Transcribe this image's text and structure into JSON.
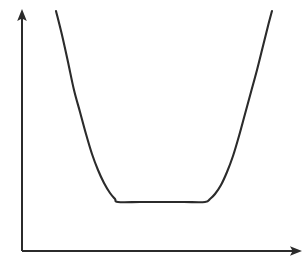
{
  "figure": {
    "title": "",
    "caption": "",
    "background_color": "#ffffff",
    "width": 305,
    "height": 271
  },
  "axes": {
    "stroke_color": "#2b2b2b",
    "stroke_width": 2,
    "origin": {
      "x": 22,
      "y": 251
    },
    "x_axis": {
      "label": "",
      "has_arrowhead": true,
      "from": {
        "x": 22,
        "y": 251
      },
      "to": {
        "x": 302,
        "y": 251
      },
      "tick_labels": []
    },
    "y_axis": {
      "label": "",
      "has_arrowhead": true,
      "from": {
        "x": 22,
        "y": 251
      },
      "to": {
        "x": 22,
        "y": 9
      },
      "tick_labels": []
    },
    "grid": false,
    "legend": null
  },
  "chart_data": {
    "type": "line",
    "title": "",
    "subtitle": "",
    "xlabel": "",
    "ylabel": "",
    "grid": false,
    "legend_position": "none",
    "xlim": [
      22,
      302
    ],
    "ylim": [
      251,
      9
    ],
    "axis_direction": {
      "x": "rightward-increasing",
      "y": "upward-increasing"
    },
    "series": [
      {
        "name": "flat-bottomed-u-curve",
        "color": "#2b2b2b",
        "stroke_width": 2.1,
        "description": "Steep descending left branch, flat plateau minimum, steep ascending right branch",
        "points": [
          {
            "x": 56,
            "y": 11
          },
          {
            "x": 62,
            "y": 35
          },
          {
            "x": 68,
            "y": 62
          },
          {
            "x": 74,
            "y": 90
          },
          {
            "x": 80,
            "y": 112
          },
          {
            "x": 86,
            "y": 134
          },
          {
            "x": 92,
            "y": 154
          },
          {
            "x": 98,
            "y": 170
          },
          {
            "x": 104,
            "y": 183
          },
          {
            "x": 110,
            "y": 193
          },
          {
            "x": 115,
            "y": 199
          },
          {
            "x": 118,
            "y": 202
          },
          {
            "x": 140,
            "y": 202
          },
          {
            "x": 162,
            "y": 202
          },
          {
            "x": 184,
            "y": 202
          },
          {
            "x": 205,
            "y": 202
          },
          {
            "x": 210,
            "y": 199
          },
          {
            "x": 215,
            "y": 194
          },
          {
            "x": 221,
            "y": 185
          },
          {
            "x": 227,
            "y": 172
          },
          {
            "x": 233,
            "y": 156
          },
          {
            "x": 239,
            "y": 136
          },
          {
            "x": 245,
            "y": 114
          },
          {
            "x": 251,
            "y": 92
          },
          {
            "x": 257,
            "y": 70
          },
          {
            "x": 263,
            "y": 46
          },
          {
            "x": 268,
            "y": 26
          },
          {
            "x": 272,
            "y": 11
          }
        ]
      }
    ],
    "annotations": [],
    "features": {
      "minimum_plateau": {
        "x_start": 118,
        "x_end": 205,
        "y": 202
      },
      "left_branch_top": {
        "x": 56,
        "y": 11
      },
      "right_branch_top": {
        "x": 272,
        "y": 11
      },
      "symmetry": "approximately symmetric about x = 161"
    }
  }
}
